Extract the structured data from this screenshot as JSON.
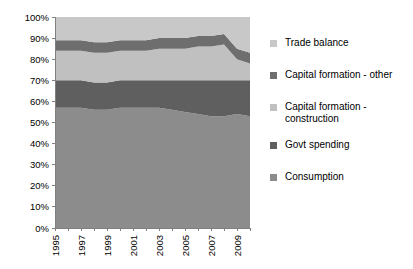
{
  "chart_data": {
    "type": "area",
    "stacked": true,
    "normalized": true,
    "title": "",
    "subtitle": "",
    "xlabel": "",
    "ylabel": "",
    "xlim": [
      1995,
      2010
    ],
    "ylim": [
      0,
      100
    ],
    "grid": false,
    "legend_position": "right",
    "x": [
      1995,
      1996,
      1997,
      1998,
      1999,
      2000,
      2001,
      2002,
      2003,
      2004,
      2005,
      2006,
      2007,
      2008,
      2009,
      2010
    ],
    "x_tick_values": [
      1995,
      1996,
      1997,
      1998,
      1999,
      2000,
      2001,
      2002,
      2003,
      2004,
      2005,
      2006,
      2007,
      2008,
      2009,
      2010
    ],
    "x_tick_labels": [
      "1995",
      "",
      "1997",
      "",
      "1999",
      "",
      "2001",
      "",
      "2003",
      "",
      "2005",
      "",
      "2007",
      "",
      "2009",
      ""
    ],
    "y_tick_values": [
      0,
      10,
      20,
      30,
      40,
      50,
      60,
      70,
      80,
      90,
      100
    ],
    "y_tick_labels": [
      "0%",
      "10%",
      "20%",
      "30%",
      "40%",
      "50%",
      "60%",
      "70%",
      "80%",
      "90%",
      "100%"
    ],
    "series": [
      {
        "name": "Consumption",
        "color": "#8C8C8C",
        "values": [
          57,
          57,
          57,
          56,
          56,
          57,
          57,
          57,
          57,
          56,
          55,
          54,
          53,
          53,
          54,
          53
        ]
      },
      {
        "name": "Govt spending",
        "color": "#5F5F5F",
        "values": [
          13,
          13,
          13,
          13,
          13,
          13,
          13,
          13,
          13,
          14,
          15,
          16,
          17,
          17,
          16,
          17
        ]
      },
      {
        "name": "Capital formation - construction",
        "color": "#C0C0C0",
        "values": [
          14,
          14,
          14,
          14,
          14,
          14,
          14,
          14,
          15,
          15,
          15,
          16,
          16,
          17,
          10,
          8
        ]
      },
      {
        "name": "Capital formation - other",
        "color": "#6E6E6E",
        "values": [
          5,
          5,
          5,
          5,
          5,
          5,
          5,
          5,
          5,
          5,
          5,
          5,
          5,
          5,
          5,
          5
        ]
      },
      {
        "name": "Trade balance",
        "color": "#C8C8C8",
        "values": [
          11,
          11,
          11,
          12,
          12,
          11,
          11,
          11,
          10,
          10,
          10,
          9,
          9,
          8,
          15,
          17
        ]
      }
    ]
  },
  "legend": {
    "items": [
      {
        "label": "Trade balance",
        "color": "#C8C8C8"
      },
      {
        "label": "Capital formation - other",
        "color": "#6E6E6E"
      },
      {
        "label": "Capital formation - construction",
        "color": "#C0C0C0"
      },
      {
        "label": "Govt spending",
        "color": "#5F5F5F"
      },
      {
        "label": "Consumption",
        "color": "#8C8C8C"
      }
    ]
  },
  "axes": {
    "plot_background": "#FFFFFF",
    "axis_color": "#808080"
  }
}
